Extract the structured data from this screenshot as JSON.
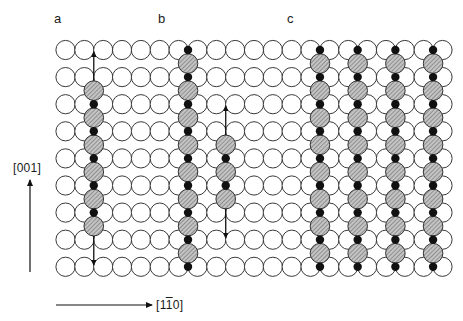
{
  "panels": {
    "a": {
      "label": "a",
      "x": 54,
      "y": 12
    },
    "b": {
      "label": "b",
      "x": 158,
      "y": 12
    },
    "c": {
      "label": "c",
      "x": 287,
      "y": 12
    }
  },
  "axes": {
    "vertical": {
      "label": "[001]",
      "x1": 30,
      "y1": 272,
      "x2": 30,
      "y2": 180,
      "label_x": 13,
      "label_y": 162
    },
    "horizontal": {
      "label_prefix": "[1",
      "label_bar": "1",
      "label_suffix": "0]",
      "x1": 56,
      "y1": 305,
      "x2": 152,
      "y2": 305,
      "label_x": 156,
      "label_y": 299
    }
  },
  "grid": {
    "columns": 21,
    "rows": 9,
    "x0": 65.5,
    "dx": 18.85,
    "y0": 50,
    "dy": 27.1,
    "radius": 9.6,
    "stroke": "#3a3a3a",
    "fill": "#ffffff"
  },
  "adatom_style": {
    "hatched_fill": "#bdbdbd",
    "hatch_stroke": "#555555",
    "dot_fill": "#111111",
    "dot_radius": 4.2,
    "hatched_radius": 9.8
  },
  "chains": [
    {
      "panel": "a",
      "between_col": 1,
      "hatched_rows_from": 1,
      "hatched_rows_to": 6,
      "dots_rows": [
        2,
        3,
        4,
        5,
        6
      ],
      "arrow_up_to_row": 0,
      "arrow_down_to_row": 8
    },
    {
      "panel": "b",
      "between_col": 6,
      "hatched_rows_from": 0,
      "hatched_rows_to": 8,
      "dots_rows": [
        0,
        1,
        2,
        3,
        4,
        5,
        6,
        7,
        8
      ],
      "arrow_up_to_row": null,
      "arrow_down_to_row": null
    },
    {
      "panel": "b",
      "between_col": 8,
      "hatched_rows_from": 3,
      "hatched_rows_to": 5,
      "dots_rows": [
        4,
        5
      ],
      "arrow_up_to_row": 2,
      "arrow_down_to_row": 7
    },
    {
      "panel": "c",
      "between_col": 13,
      "hatched_rows_from": 0,
      "hatched_rows_to": 8,
      "dots_rows": [
        0,
        1,
        2,
        3,
        4,
        5,
        6,
        7,
        8
      ],
      "arrow_up_to_row": null,
      "arrow_down_to_row": null
    },
    {
      "panel": "c",
      "between_col": 15,
      "hatched_rows_from": 0,
      "hatched_rows_to": 8,
      "dots_rows": [
        0,
        1,
        2,
        3,
        4,
        5,
        6,
        7,
        8
      ],
      "arrow_up_to_row": null,
      "arrow_down_to_row": null
    },
    {
      "panel": "c",
      "between_col": 17,
      "hatched_rows_from": 0,
      "hatched_rows_to": 8,
      "dots_rows": [
        0,
        1,
        2,
        3,
        4,
        5,
        6,
        7,
        8
      ],
      "arrow_up_to_row": null,
      "arrow_down_to_row": null
    },
    {
      "panel": "c",
      "between_col": 19,
      "hatched_rows_from": 0,
      "hatched_rows_to": 8,
      "dots_rows": [
        0,
        1,
        2,
        3,
        4,
        5,
        6,
        7,
        8
      ],
      "arrow_up_to_row": null,
      "arrow_down_to_row": null
    }
  ]
}
